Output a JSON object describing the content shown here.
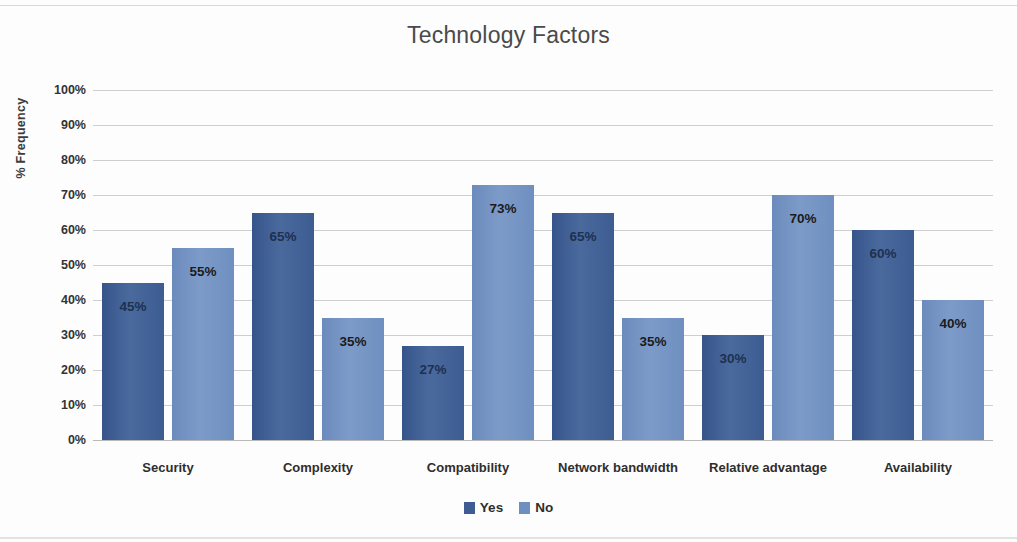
{
  "chart_data": {
    "type": "bar",
    "title": "Technology Factors",
    "xlabel": "",
    "ylabel": "% Frequency",
    "ylim": [
      0,
      100
    ],
    "ytick_labels": [
      "100%",
      "90%",
      "80%",
      "70%",
      "60%",
      "50%",
      "40%",
      "30%",
      "20%",
      "10%",
      "0%"
    ],
    "ytick_values": [
      100,
      90,
      80,
      70,
      60,
      50,
      40,
      30,
      20,
      10,
      0
    ],
    "grid": true,
    "legend_position": "bottom",
    "categories": [
      "Security",
      "Complexity",
      "Compatibility",
      "Network bandwidth",
      "Relative advantage",
      "Availability"
    ],
    "series": [
      {
        "name": "Yes",
        "color": "#3d5d92",
        "values": [
          45,
          65,
          27,
          65,
          30,
          60
        ],
        "labels": [
          "45%",
          "65%",
          "27%",
          "65%",
          "30%",
          "60%"
        ]
      },
      {
        "name": "No",
        "color": "#6e8fc0",
        "values": [
          55,
          35,
          73,
          35,
          70,
          40
        ],
        "labels": [
          "55%",
          "35%",
          "73%",
          "35%",
          "70%",
          "40%"
        ]
      }
    ]
  },
  "legend": {
    "items": [
      {
        "label": "Yes",
        "color": "#3d5d92"
      },
      {
        "label": "No",
        "color": "#6e8fc0"
      }
    ]
  }
}
